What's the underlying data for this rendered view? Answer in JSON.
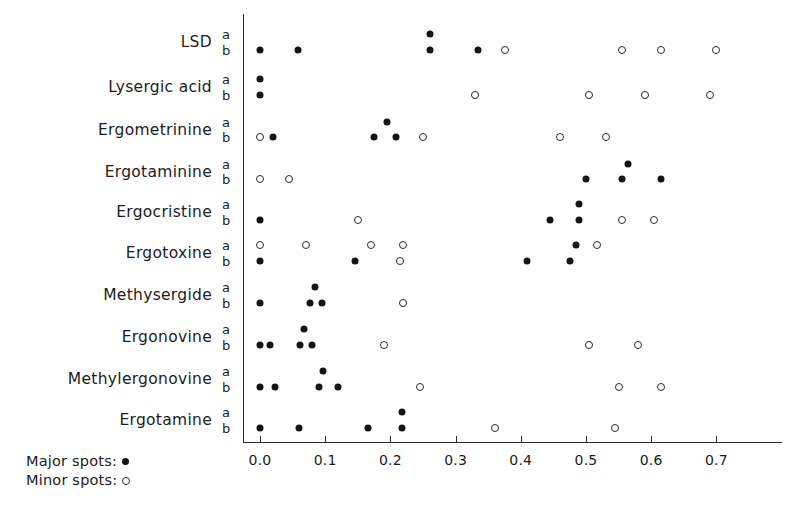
{
  "figure": {
    "title": "",
    "legend": {
      "major_label": "Major spots:",
      "minor_label": "Minor spots:",
      "major_icon": "filled-circle",
      "minor_icon": "open-circle"
    },
    "sub_row_tags": {
      "upper": "a",
      "lower": "b"
    },
    "colors": {
      "major_spot": "#141414",
      "minor_spot_stroke": "#2b2b2b",
      "axis": "#2a2a2a",
      "text": "#1c1c1c",
      "background": "#ffffff"
    }
  },
  "chart_data": {
    "type": "scatter",
    "title": "",
    "xlabel": "",
    "ylabel": "",
    "xlim": [
      -0.02,
      0.75
    ],
    "xticks": [
      0.0,
      0.1,
      0.2,
      0.3,
      0.4,
      0.5,
      0.6,
      0.7
    ],
    "xticklabels": [
      "0.0",
      "0.1",
      "0.2",
      "0.3",
      "0.4",
      "0.5",
      "0.6",
      "0.7"
    ],
    "grid": false,
    "legend_position": "bottom-left",
    "series": [
      {
        "name": "Major spots",
        "marker": "filled-circle"
      },
      {
        "name": "Minor spots",
        "marker": "open-circle"
      }
    ],
    "categories": [
      "LSD",
      "Lysergic acid",
      "Ergometrinine",
      "Ergotaminine",
      "Ergocristine",
      "Ergotoxine",
      "Methysergide",
      "Ergonovine",
      "Methylergonovine",
      "Ergotamine"
    ],
    "rows": [
      {
        "label": "LSD",
        "a": {
          "major": [
            0.26
          ],
          "minor": []
        },
        "b": {
          "major": [
            0.0,
            0.058,
            0.26,
            0.335
          ],
          "minor": [
            0.375,
            0.555,
            0.615,
            0.7
          ]
        }
      },
      {
        "label": "Lysergic acid",
        "a": {
          "major": [
            0.0
          ],
          "minor": []
        },
        "b": {
          "major": [
            0.0
          ],
          "minor": [
            0.33,
            0.505,
            0.59,
            0.69
          ]
        }
      },
      {
        "label": "Ergometrinine",
        "a": {
          "major": [
            0.195
          ],
          "minor": []
        },
        "b": {
          "major": [
            0.02,
            0.175,
            0.208
          ],
          "minor": [
            0.0,
            0.25,
            0.46,
            0.53
          ]
        }
      },
      {
        "label": "Ergotaminine",
        "a": {
          "major": [
            0.565
          ],
          "minor": []
        },
        "b": {
          "major": [
            0.5,
            0.555,
            0.615
          ],
          "minor": [
            0.0,
            0.045
          ]
        }
      },
      {
        "label": "Ergocristine",
        "a": {
          "major": [
            0.49
          ],
          "minor": []
        },
        "b": {
          "major": [
            0.0,
            0.445,
            0.49
          ],
          "minor": [
            0.15,
            0.555,
            0.605
          ]
        }
      },
      {
        "label": "Ergotoxine",
        "a": {
          "major": [
            0.485
          ],
          "minor": [
            0.0,
            0.07,
            0.17,
            0.22,
            0.517
          ]
        },
        "b": {
          "major": [
            0.0,
            0.145,
            0.41,
            0.475
          ],
          "minor": [
            0.215
          ]
        }
      },
      {
        "label": "Methysergide",
        "a": {
          "major": [
            0.085
          ],
          "minor": []
        },
        "b": {
          "major": [
            0.0,
            0.077,
            0.095
          ],
          "minor": [
            0.22
          ]
        }
      },
      {
        "label": "Ergonovine",
        "a": {
          "major": [
            0.068
          ],
          "minor": []
        },
        "b": {
          "major": [
            0.0,
            0.015,
            0.062,
            0.08
          ],
          "minor": [
            0.19,
            0.505,
            0.58
          ]
        }
      },
      {
        "label": "Methylergonovine",
        "a": {
          "major": [
            0.097
          ],
          "minor": []
        },
        "b": {
          "major": [
            0.0,
            0.023,
            0.09,
            0.12
          ],
          "minor": [
            0.245,
            0.55,
            0.615
          ]
        }
      },
      {
        "label": "Ergotamine",
        "a": {
          "major": [
            0.218
          ],
          "minor": []
        },
        "b": {
          "major": [
            0.0,
            0.06,
            0.165,
            0.218
          ],
          "minor": [
            0.36,
            0.545
          ]
        }
      }
    ]
  },
  "geometry": {
    "x0_px": 260,
    "px_per_unit": 652,
    "axis_top_px": 14,
    "axis_bottom_px": 442,
    "axis_right_px": 782,
    "row_y": [
      {
        "a": 34,
        "b": 50
      },
      {
        "a": 79,
        "b": 95
      },
      {
        "a": 122,
        "b": 137
      },
      {
        "a": 164,
        "b": 179
      },
      {
        "a": 204,
        "b": 220
      },
      {
        "a": 245,
        "b": 261
      },
      {
        "a": 287,
        "b": 303
      },
      {
        "a": 329,
        "b": 345
      },
      {
        "a": 371,
        "b": 387
      },
      {
        "a": 412,
        "b": 428
      }
    ],
    "label_y": [
      42,
      87,
      130,
      172,
      212,
      253,
      295,
      337,
      379,
      420
    ],
    "ab_tag_x": 222
  }
}
